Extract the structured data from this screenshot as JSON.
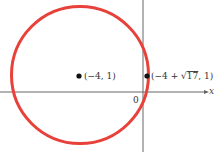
{
  "diagram": {
    "type": "circle-on-coordinate-plane",
    "circle": {
      "center": [
        -4,
        1
      ],
      "radius_expr": "sqrt(17)",
      "color": "#e8413a"
    },
    "points": [
      {
        "label": "(−4, 1)"
      },
      {
        "label_prefix": "(−4 + ",
        "label_sqrt": "17",
        "label_suffix": ", 1)"
      }
    ],
    "axes": {
      "x_label": "x",
      "origin_label": "0"
    },
    "colors": {
      "axis": "#555555",
      "point": "#111111"
    }
  }
}
